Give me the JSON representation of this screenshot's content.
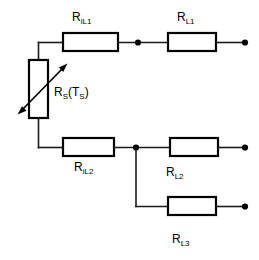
{
  "diagram": {
    "type": "electrical-circuit-schematic",
    "background_color": "#ffffff",
    "line_color": "#000000",
    "components": [
      {
        "id": "r-il1",
        "kind": "resistor",
        "label_main": "R",
        "label_sub": "iL1",
        "label_full": "RiL1",
        "x": 63,
        "y": 33,
        "w": 55,
        "h": 18,
        "orientation": "horizontal"
      },
      {
        "id": "r-l1",
        "kind": "resistor",
        "label_main": "R",
        "label_sub": "L1",
        "label_full": "RL1",
        "x": 168,
        "y": 33,
        "w": 48,
        "h": 18,
        "orientation": "horizontal"
      },
      {
        "id": "r-s",
        "kind": "variable-resistor",
        "label_main": "R",
        "label_sub": "S",
        "label_paren_open": "(T",
        "label_paren_sub": "S",
        "label_paren_close": ")",
        "label_full": "RS(TS)",
        "x": 29,
        "y": 60,
        "w": 19,
        "h": 58,
        "orientation": "vertical"
      },
      {
        "id": "r-il2",
        "kind": "resistor",
        "label_main": "R",
        "label_sub": "iL2",
        "label_full": "RiL2",
        "x": 63,
        "y": 138,
        "w": 51,
        "h": 18,
        "orientation": "horizontal"
      },
      {
        "id": "r-l2",
        "kind": "resistor",
        "label_main": "R",
        "label_sub": "L2",
        "label_full": "RL2",
        "x": 170,
        "y": 138,
        "w": 48,
        "h": 18,
        "orientation": "horizontal"
      },
      {
        "id": "r-l3",
        "kind": "resistor",
        "label_main": "R",
        "label_sub": "L3",
        "label_full": "RL3",
        "x": 168,
        "y": 197,
        "w": 48,
        "h": 18,
        "orientation": "horizontal"
      }
    ],
    "junction_nodes": [
      {
        "id": "node-top",
        "x": 138,
        "y": 42
      },
      {
        "id": "node-bottom",
        "x": 136,
        "y": 147
      }
    ],
    "terminals": [
      {
        "id": "terminal-l1",
        "x": 245,
        "y": 42
      },
      {
        "id": "terminal-l2",
        "x": 245,
        "y": 147
      },
      {
        "id": "terminal-l3",
        "x": 245,
        "y": 206
      }
    ],
    "labels": {
      "r_il1": {
        "main": "R",
        "sub": "iL1",
        "x": 72,
        "y": 11
      },
      "r_l1": {
        "main": "R",
        "sub": "L1",
        "x": 177,
        "y": 11
      },
      "r_s": {
        "main": "R",
        "sub": "S",
        "paren_open": "(T",
        "paren_sub": "S",
        "paren_close": ")",
        "x": 54,
        "y": 86
      },
      "r_il2": {
        "main": "R",
        "sub": "iL2",
        "x": 74,
        "y": 161
      },
      "r_l2": {
        "main": "R",
        "sub": "L2",
        "x": 166,
        "y": 166
      },
      "r_l3": {
        "main": "R",
        "sub": "L3",
        "x": 172,
        "y": 233
      }
    }
  }
}
